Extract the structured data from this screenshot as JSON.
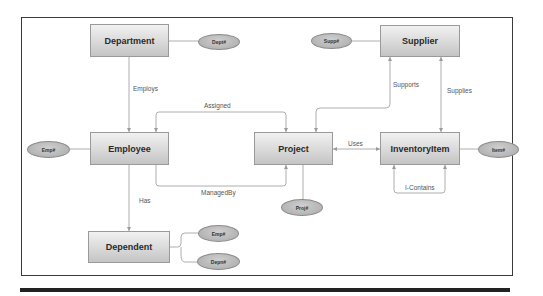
{
  "diagram": {
    "type": "entity-relationship",
    "colors": {
      "entity_fill": "#d9d9d9",
      "attribute_fill": "#b5b5b5",
      "line": "#9a9a9a",
      "frame": "#3a3a3a"
    },
    "entities": {
      "department": {
        "label": "Department"
      },
      "employee": {
        "label": "Employee"
      },
      "dependent": {
        "label": "Dependent"
      },
      "project": {
        "label": "Project"
      },
      "supplier": {
        "label": "Supplier"
      },
      "inventory_item": {
        "label": "InventoryItem"
      }
    },
    "attributes": {
      "dept_no": {
        "label": "Dept#",
        "entity": "Department"
      },
      "emp_no": {
        "label": "Emp#",
        "entity": "Employee"
      },
      "dependent_emp_no": {
        "label": "Emp#",
        "entity": "Dependent"
      },
      "depn_no": {
        "label": "Depn#",
        "entity": "Dependent"
      },
      "proj_no": {
        "label": "Proj#",
        "entity": "Project"
      },
      "supp_no": {
        "label": "Supp#",
        "entity": "Supplier"
      },
      "item_no": {
        "label": "Item#",
        "entity": "InventoryItem"
      }
    },
    "relationships": {
      "employs": {
        "label": "Employs",
        "from": "Department",
        "to": "Employee"
      },
      "assigned": {
        "label": "Assigned",
        "from": "Project",
        "to": "Employee"
      },
      "managed_by": {
        "label": "ManagedBy",
        "from": "Employee",
        "to": "Project"
      },
      "has": {
        "label": "Has",
        "from": "Employee",
        "to": "Dependent"
      },
      "uses": {
        "label": "Uses",
        "from": "Project",
        "to": "InventoryItem"
      },
      "supports": {
        "label": "Supports",
        "from": "Supplier",
        "to": "Project"
      },
      "supplies": {
        "label": "Supplies",
        "from": "Supplier",
        "to": "InventoryItem"
      },
      "i_contains": {
        "label": "I-Contains",
        "from": "InventoryItem",
        "to": "InventoryItem"
      }
    }
  }
}
